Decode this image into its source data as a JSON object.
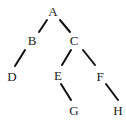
{
  "diagram": {
    "type": "tree",
    "nodes": [
      {
        "id": "A",
        "label": "A",
        "x": 53,
        "y": 16
      },
      {
        "id": "B",
        "label": "B",
        "x": 32,
        "y": 45
      },
      {
        "id": "C",
        "label": "C",
        "x": 74,
        "y": 45
      },
      {
        "id": "D",
        "label": "D",
        "x": 12,
        "y": 81
      },
      {
        "id": "E",
        "label": "E",
        "x": 58,
        "y": 80
      },
      {
        "id": "F",
        "label": "F",
        "x": 100,
        "y": 81
      },
      {
        "id": "G",
        "label": "G",
        "x": 74,
        "y": 115
      },
      {
        "id": "H",
        "label": "H",
        "x": 118,
        "y": 115
      }
    ],
    "edges": [
      {
        "from": "A",
        "to": "B",
        "x1": 47,
        "y1": 20,
        "x2": 39,
        "y2": 32
      },
      {
        "from": "A",
        "to": "C",
        "x1": 60,
        "y1": 20,
        "x2": 70,
        "y2": 32
      },
      {
        "from": "B",
        "to": "D",
        "x1": 25,
        "y1": 50,
        "x2": 15,
        "y2": 66
      },
      {
        "from": "C",
        "to": "E",
        "x1": 71,
        "y1": 50,
        "x2": 62,
        "y2": 65
      },
      {
        "from": "C",
        "to": "F",
        "x1": 83,
        "y1": 50,
        "x2": 95,
        "y2": 65
      },
      {
        "from": "E",
        "to": "G",
        "x1": 61,
        "y1": 84,
        "x2": 71,
        "y2": 100
      },
      {
        "from": "F",
        "to": "H",
        "x1": 106,
        "y1": 84,
        "x2": 118,
        "y2": 100
      }
    ]
  }
}
